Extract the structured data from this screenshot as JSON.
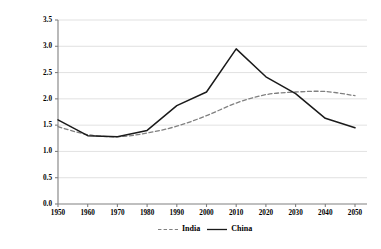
{
  "chart_data": {
    "type": "line",
    "title": "",
    "xlabel": "",
    "ylabel": "Ratio of working-age to non-working-age population",
    "x": [
      1950,
      1960,
      1970,
      1980,
      1990,
      2000,
      2010,
      2020,
      2030,
      2040,
      2050
    ],
    "xlim": [
      1945,
      2055
    ],
    "ylim": [
      0.0,
      3.5
    ],
    "ytick_labels": [
      "0.0",
      "0.5",
      "1.0",
      "1.5",
      "2.0",
      "2.5",
      "3.0",
      "3.5"
    ],
    "ytick_values": [
      0.0,
      0.5,
      1.0,
      1.5,
      2.0,
      2.5,
      3.0,
      3.5
    ],
    "xtick_labels": [
      "1950",
      "1960",
      "1970",
      "1980",
      "1990",
      "2000",
      "2010",
      "2020",
      "2030",
      "2040",
      "2050"
    ],
    "grid": "horizontal",
    "legend_position": "bottom-center",
    "series": [
      {
        "name": "India",
        "style": "dashed",
        "color": "#808080",
        "values": [
          1.47,
          1.32,
          1.28,
          1.35,
          1.48,
          1.68,
          1.92,
          2.08,
          2.13,
          2.14,
          2.06
        ]
      },
      {
        "name": "China",
        "style": "solid",
        "color": "#1a1a1a",
        "values": [
          1.6,
          1.3,
          1.28,
          1.4,
          1.87,
          2.13,
          2.95,
          2.42,
          2.1,
          1.63,
          1.45
        ]
      }
    ]
  },
  "legend": {
    "india_label": "India",
    "china_label": "China"
  },
  "axis": {
    "y_title": "Ratio of working-age to non-working-age population"
  }
}
